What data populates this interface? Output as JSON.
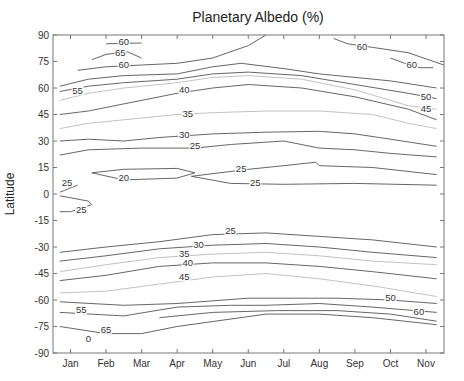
{
  "chart_data": {
    "type": "contour",
    "title": "Planetary Albedo (%)",
    "xlabel": "",
    "ylabel": "Latitude",
    "x_categories": [
      "Jan",
      "Feb",
      "Mar",
      "Apr",
      "May",
      "Jun",
      "Jul",
      "Aug",
      "Sep",
      "Oct",
      "Nov"
    ],
    "y_ticks": [
      90,
      75,
      60,
      45,
      30,
      15,
      0,
      -15,
      -30,
      -45,
      -60,
      -75,
      -90
    ],
    "ylim": [
      -90,
      90
    ],
    "grid": false,
    "contour_levels": [
      20,
      25,
      30,
      35,
      40,
      45,
      50,
      55,
      60,
      65
    ],
    "approx_contours": [
      {
        "level": 65,
        "points": [
          [
            0.6,
            76
          ],
          [
            1.0,
            79
          ],
          [
            1.6,
            80.5
          ],
          [
            2.0,
            77
          ]
        ],
        "label": "65",
        "label_at": [
          1.4,
          78.5
        ]
      },
      {
        "level": 60,
        "points": [
          [
            1.0,
            85
          ],
          [
            2.0,
            85.5
          ]
        ],
        "label": "60",
        "label_at": [
          1.5,
          85
        ]
      },
      {
        "level": 60,
        "points": [
          [
            0.2,
            70
          ],
          [
            1.0,
            72
          ],
          [
            2.0,
            73
          ],
          [
            3.0,
            74
          ],
          [
            4.0,
            77
          ],
          [
            5.0,
            84
          ],
          [
            5.5,
            90
          ]
        ],
        "label": "60",
        "label_at": [
          1.5,
          72
        ]
      },
      {
        "level": 60,
        "points": [
          [
            7.4,
            88
          ],
          [
            7.8,
            85
          ],
          [
            8.5,
            83
          ],
          [
            9.5,
            80
          ],
          [
            10.5,
            73
          ]
        ],
        "label": "60",
        "label_at": [
          8.2,
          82
        ]
      },
      {
        "level": 60,
        "points": [
          [
            9.0,
            77
          ],
          [
            9.4,
            74
          ],
          [
            9.8,
            71.5
          ],
          [
            10.2,
            71.5
          ]
        ],
        "label": "60",
        "label_at": [
          9.6,
          72
        ]
      },
      {
        "level": 55,
        "points": [
          [
            -0.3,
            61
          ],
          [
            0.5,
            65
          ],
          [
            1.5,
            67
          ],
          [
            3.0,
            68
          ],
          [
            4.0,
            72
          ],
          [
            4.8,
            74
          ],
          [
            6.0,
            71
          ],
          [
            7.0,
            68
          ],
          [
            8.0,
            66
          ],
          [
            9.0,
            64
          ],
          [
            10.3,
            60
          ]
        ],
        "label": "55",
        "label_at": [
          0.2,
          57
        ]
      },
      {
        "level": 50,
        "points": [
          [
            -0.3,
            58
          ],
          [
            0.5,
            61
          ],
          [
            1.5,
            63
          ],
          [
            3.0,
            65
          ],
          [
            4.0,
            68
          ],
          [
            5.0,
            69
          ],
          [
            6.5,
            67
          ],
          [
            8.0,
            62
          ],
          [
            9.5,
            57
          ],
          [
            10.3,
            54
          ]
        ],
        "label": "50",
        "label_at": [
          10.0,
          54
        ]
      },
      {
        "level": 45,
        "points": [
          [
            -0.3,
            53
          ],
          [
            0.5,
            57
          ],
          [
            1.5,
            60
          ],
          [
            3.0,
            63
          ],
          [
            4.0,
            66
          ],
          [
            5.0,
            67
          ],
          [
            6.5,
            65
          ],
          [
            8.0,
            59
          ],
          [
            9.5,
            50
          ],
          [
            10.3,
            48
          ]
        ],
        "label": "45",
        "label_at": [
          10.0,
          47
        ]
      },
      {
        "level": 40,
        "points": [
          [
            -0.3,
            45
          ],
          [
            0.5,
            47
          ],
          [
            1.5,
            51
          ],
          [
            3.0,
            57
          ],
          [
            4.0,
            60
          ],
          [
            5.0,
            62
          ],
          [
            6.5,
            60
          ],
          [
            8.0,
            55
          ],
          [
            9.5,
            48
          ],
          [
            10.3,
            42
          ]
        ],
        "label": "40",
        "label_at": [
          3.2,
          58
        ]
      },
      {
        "level": 35,
        "points": [
          [
            -0.3,
            37
          ],
          [
            0.5,
            40
          ],
          [
            1.5,
            42
          ],
          [
            3.0,
            45
          ],
          [
            4.0,
            46
          ],
          [
            5.5,
            47
          ],
          [
            7.0,
            47
          ],
          [
            8.5,
            45
          ],
          [
            9.5,
            40
          ],
          [
            10.3,
            37
          ]
        ],
        "label": "35",
        "label_at": [
          3.3,
          44
        ]
      },
      {
        "level": 30,
        "points": [
          [
            -0.3,
            30
          ],
          [
            0.5,
            31
          ],
          [
            1.5,
            30
          ],
          [
            2.5,
            32
          ],
          [
            4.0,
            34
          ],
          [
            5.5,
            35
          ],
          [
            7.0,
            35.5
          ],
          [
            8.0,
            34
          ],
          [
            9.0,
            31
          ],
          [
            10.3,
            27
          ]
        ],
        "label": "30",
        "label_at": [
          3.2,
          32
        ]
      },
      {
        "level": 25,
        "points": [
          [
            -0.3,
            22
          ],
          [
            0.5,
            25
          ],
          [
            2.0,
            26
          ],
          [
            3.5,
            26
          ],
          [
            4.5,
            28
          ],
          [
            6.0,
            30
          ],
          [
            7.0,
            26
          ],
          [
            8.0,
            25
          ],
          [
            9.0,
            23
          ],
          [
            10.3,
            21
          ]
        ],
        "label": "25",
        "label_at": [
          3.5,
          26
        ]
      },
      {
        "level": 25,
        "points": [
          [
            3.4,
            10
          ],
          [
            5.0,
            14
          ],
          [
            6.0,
            16
          ],
          [
            6.9,
            18
          ],
          [
            7.0,
            16
          ],
          [
            8.5,
            15
          ],
          [
            10.3,
            11
          ]
        ],
        "label": "25",
        "label_at": [
          4.8,
          13
        ]
      },
      {
        "level": 25,
        "points": [
          [
            3.4,
            10
          ],
          [
            4.5,
            6
          ],
          [
            6.0,
            5.5
          ],
          [
            8.0,
            6
          ],
          [
            10.3,
            5
          ]
        ],
        "label": "25",
        "label_at": [
          5.2,
          5
        ]
      },
      {
        "level": 20,
        "points": [
          [
            0.6,
            12
          ],
          [
            1.5,
            14
          ],
          [
            3.0,
            14.5
          ],
          [
            3.5,
            12
          ],
          [
            3.0,
            9
          ],
          [
            1.5,
            8
          ],
          [
            0.6,
            12
          ]
        ],
        "label": "20",
        "label_at": [
          1.5,
          8
        ]
      },
      {
        "level": 25,
        "points": [
          [
            -0.3,
            1
          ],
          [
            0.2,
            5
          ]
        ],
        "label": "25",
        "label_at": [
          -0.1,
          5
        ]
      },
      {
        "level": 25,
        "points": [
          [
            -0.3,
            -1
          ],
          [
            0.5,
            -4
          ],
          [
            0.6,
            -6
          ],
          [
            0.0,
            -10
          ],
          [
            -0.3,
            -10
          ]
        ],
        "label": "25",
        "label_at": [
          0.3,
          -10
        ]
      },
      {
        "level": 25,
        "points": [
          [
            -0.3,
            -33
          ],
          [
            1.0,
            -30
          ],
          [
            2.5,
            -27
          ],
          [
            4.0,
            -23
          ],
          [
            5.5,
            -22
          ],
          [
            7.0,
            -24
          ],
          [
            8.5,
            -26
          ],
          [
            10.3,
            -30
          ]
        ],
        "label": "25",
        "label_at": [
          4.5,
          -22
        ]
      },
      {
        "level": 30,
        "points": [
          [
            -0.3,
            -38
          ],
          [
            1.0,
            -35
          ],
          [
            2.5,
            -31
          ],
          [
            4.0,
            -29
          ],
          [
            5.5,
            -28
          ],
          [
            7.0,
            -30
          ],
          [
            8.5,
            -33
          ],
          [
            10.3,
            -36
          ]
        ],
        "label": "30",
        "label_at": [
          3.6,
          -30
        ]
      },
      {
        "level": 35,
        "points": [
          [
            -0.3,
            -44
          ],
          [
            1.0,
            -40
          ],
          [
            2.5,
            -36
          ],
          [
            4.0,
            -34
          ],
          [
            5.5,
            -33
          ],
          [
            7.0,
            -35
          ],
          [
            8.5,
            -38
          ],
          [
            10.3,
            -40
          ]
        ],
        "label": "35",
        "label_at": [
          3.2,
          -35
        ]
      },
      {
        "level": 40,
        "points": [
          [
            -0.3,
            -49
          ],
          [
            1.0,
            -46
          ],
          [
            2.5,
            -41
          ],
          [
            4.0,
            -39
          ],
          [
            5.5,
            -39
          ],
          [
            7.0,
            -41
          ],
          [
            8.5,
            -44
          ],
          [
            10.3,
            -48
          ]
        ],
        "label": "40",
        "label_at": [
          3.3,
          -40
        ]
      },
      {
        "level": 45,
        "points": [
          [
            -0.3,
            -56
          ],
          [
            1.0,
            -55
          ],
          [
            2.5,
            -51
          ],
          [
            4.0,
            -47
          ],
          [
            5.5,
            -45
          ],
          [
            7.0,
            -48
          ],
          [
            8.5,
            -52
          ],
          [
            10.3,
            -58
          ]
        ],
        "label": "45",
        "label_at": [
          3.2,
          -48
        ]
      },
      {
        "level": 50,
        "points": [
          [
            -0.3,
            -61
          ],
          [
            1.5,
            -63
          ],
          [
            3.0,
            -62
          ],
          [
            5.0,
            -59
          ],
          [
            6.0,
            -59
          ],
          [
            7.5,
            -59
          ],
          [
            9.0,
            -60
          ],
          [
            10.3,
            -62
          ]
        ],
        "label": "50",
        "label_at": [
          9.0,
          -60
        ]
      },
      {
        "level": 55,
        "points": [
          [
            -0.3,
            -67
          ],
          [
            1.5,
            -69
          ],
          [
            3.0,
            -64
          ],
          [
            4.5,
            -63
          ],
          [
            5.5,
            -63
          ],
          [
            7.0,
            -62
          ],
          [
            8.5,
            -64
          ],
          [
            10.3,
            -67
          ]
        ],
        "label": "55",
        "label_at": [
          0.3,
          -67
        ]
      },
      {
        "level": 60,
        "points": [
          [
            2.5,
            -70
          ],
          [
            4.0,
            -67
          ],
          [
            5.8,
            -66
          ],
          [
            7.5,
            -66
          ],
          [
            9.0,
            -68
          ],
          [
            10.3,
            -72
          ]
        ],
        "label": "60",
        "label_at": [
          9.8,
          -68
        ]
      },
      {
        "level": 65,
        "points": [
          [
            -0.3,
            -75
          ],
          [
            1.0,
            -79
          ],
          [
            2.0,
            -79
          ],
          [
            3.0,
            -75
          ],
          [
            5.5,
            -68
          ],
          [
            7.0,
            -68
          ],
          [
            8.5,
            -70
          ],
          [
            10.3,
            -74
          ]
        ],
        "label": "65",
        "label_at": [
          1.0,
          -78
        ]
      }
    ],
    "annotations": [
      {
        "text": "0",
        "x": 0.5,
        "y": -84
      }
    ]
  }
}
